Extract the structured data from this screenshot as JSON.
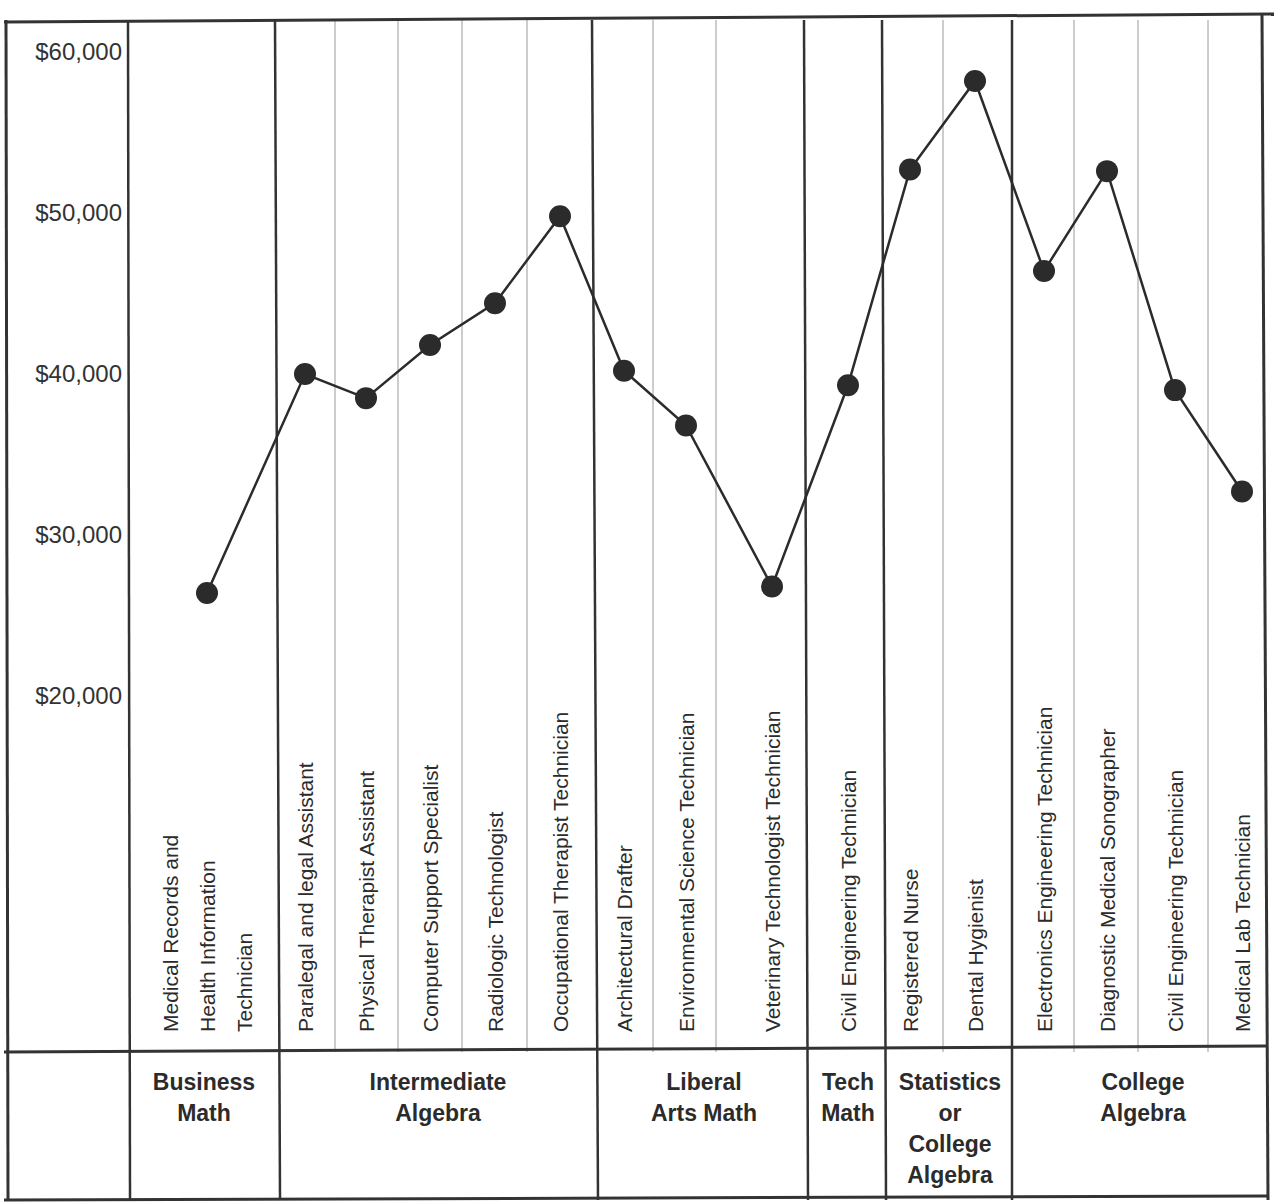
{
  "chart_data": {
    "type": "line",
    "title": "",
    "xlabel": "",
    "ylabel": "",
    "ylim": [
      10000,
      60000
    ],
    "grid": true,
    "y_ticks": [
      "$60,000",
      "$50,000",
      "$40,000",
      "$30,000",
      "$20,000"
    ],
    "y_tick_values": [
      60000,
      50000,
      40000,
      30000,
      20000
    ],
    "categories": [
      "Medical Records and Health Information Technician",
      "Paralegal and legal Assistant",
      "Physical Therapist Assistant",
      "Computer Support Specialist",
      "Radiologic Technologist",
      "Occupational Therapist Technician",
      "Architectural Drafter",
      "Environmental  Science Technician",
      "Veterinary Technologist Technician",
      "Civil Engineering Technician",
      "Registered Nurse",
      "Dental Hygienist",
      "Electronics Engineering Technician",
      "Diagnostic Medical Sonographer",
      "Civil Engineering Technician",
      "Medical Lab Technician"
    ],
    "category_lines": [
      [
        "Medical Records and",
        "Health Information",
        "Technician"
      ],
      [
        "Paralegal and legal Assistant"
      ],
      [
        "Physical Therapist Assistant"
      ],
      [
        "Computer Support Specialist"
      ],
      [
        "Radiologic Technologist"
      ],
      [
        "Occupational Therapist Technician"
      ],
      [
        "Architectural Drafter"
      ],
      [
        "Environmental  Science Technician"
      ],
      [
        "Veterinary Technologist Technician"
      ],
      [
        "Civil Engineering Technician"
      ],
      [
        "Registered Nurse"
      ],
      [
        "Dental Hygienist"
      ],
      [
        "Electronics Engineering Technician"
      ],
      [
        "Diagnostic Medical Sonographer"
      ],
      [
        "Civil Engineering Technician"
      ],
      [
        "Medical Lab Technician"
      ]
    ],
    "series": [
      {
        "name": "Salary",
        "values": [
          26400,
          40000,
          38500,
          41800,
          44400,
          49800,
          40200,
          36800,
          26800,
          39300,
          52700,
          58200,
          46400,
          52600,
          39000,
          32700
        ]
      }
    ],
    "groups": [
      {
        "label_lines": [
          "Business",
          "Math"
        ],
        "members": [
          0
        ]
      },
      {
        "label_lines": [
          "Intermediate",
          "Algebra"
        ],
        "members": [
          1,
          2,
          3,
          4,
          5
        ]
      },
      {
        "label_lines": [
          "Liberal",
          "Arts Math"
        ],
        "members": [
          6,
          7,
          8
        ]
      },
      {
        "label_lines": [
          "Tech",
          "Math"
        ],
        "members": [
          9
        ]
      },
      {
        "label_lines": [
          "Statistics",
          "or",
          "College",
          "Algebra"
        ],
        "members": [
          10,
          11
        ]
      },
      {
        "label_lines": [
          "College",
          "Algebra"
        ],
        "members": [
          12,
          13,
          14,
          15
        ]
      }
    ],
    "colors": {
      "line": "#2b2b2b",
      "marker": "#2b2b2b",
      "border": "#333333",
      "gridline": "#9a9a9a"
    }
  }
}
